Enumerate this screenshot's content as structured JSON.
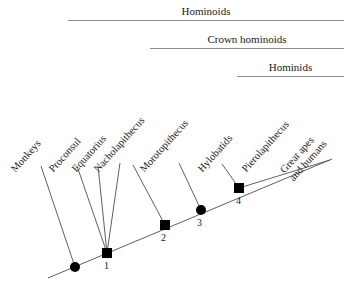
{
  "figure": {
    "type": "phylogenetic-tree",
    "background_color": "#ffffff",
    "line_color": "#4d4d4d",
    "rule_color": "#8c8c8c",
    "node_color": "#000000"
  },
  "clade_brackets": [
    {
      "id": "hominoids",
      "label": "Hominoids",
      "left": 68,
      "right": 344,
      "top": 4
    },
    {
      "id": "crown-hominoids",
      "label": "Crown hominoids",
      "left": 150,
      "right": 344,
      "top": 32
    },
    {
      "id": "hominids",
      "label": "Hominids",
      "left": 237,
      "right": 344,
      "top": 60
    }
  ],
  "taxa": [
    {
      "id": "monkeys",
      "label": "Monkeys",
      "label_x": 17,
      "label_y": 163,
      "tip_x": 41,
      "tip_y": 166,
      "base_x": 75,
      "base_y": 267
    },
    {
      "id": "proconsul",
      "label": "Proconsul",
      "label_x": 55,
      "label_y": 163,
      "tip_x": 77,
      "tip_y": 166,
      "base_x": 107,
      "base_y": 253
    },
    {
      "id": "equatorius",
      "label": "Equatorius",
      "label_x": 78,
      "label_y": 163,
      "tip_x": 98,
      "tip_y": 166,
      "base_x": 107,
      "base_y": 253
    },
    {
      "id": "nacholapithecus",
      "label": "Nacholapithecus",
      "label_x": 100,
      "label_y": 163,
      "tip_x": 120,
      "tip_y": 163,
      "base_x": 107,
      "base_y": 253
    },
    {
      "id": "morotopithecus",
      "label": "Morotopithecus",
      "label_x": 146,
      "label_y": 163,
      "tip_x": 133,
      "tip_y": 165,
      "base_x": 165,
      "base_y": 225
    },
    {
      "id": "hylobatids",
      "label": "Hylobatids",
      "label_x": 204,
      "label_y": 163,
      "tip_x": 179,
      "tip_y": 163,
      "base_x": 201,
      "base_y": 210
    },
    {
      "id": "pierolapithecus",
      "label": "Pierolapithecus",
      "label_x": 248,
      "label_y": 163,
      "tip_x": 222,
      "tip_y": 164,
      "base_x": 239,
      "base_y": 188
    },
    {
      "id": "great-apes-and-humans",
      "label": "Great apes\nand humans",
      "label_x": 295,
      "label_y": 160,
      "tip_x": 330,
      "tip_y": 160,
      "base_x": 239,
      "base_y": 188
    }
  ],
  "backbone": {
    "start_x": 48,
    "start_y": 278,
    "end_x": 332,
    "end_y": 159
  },
  "nodes": [
    {
      "id": "node-root-split",
      "shape": "circle",
      "number": "",
      "x": 75,
      "y": 267,
      "number_x": 0,
      "number_y": 0
    },
    {
      "id": "node-1",
      "shape": "square",
      "number": "1",
      "x": 107,
      "y": 253,
      "number_x": 104,
      "number_y": 261
    },
    {
      "id": "node-2",
      "shape": "square",
      "number": "2",
      "x": 165,
      "y": 225,
      "number_x": 161,
      "number_y": 233
    },
    {
      "id": "node-3",
      "shape": "circle",
      "number": "3",
      "x": 201,
      "y": 210,
      "number_x": 197,
      "number_y": 218
    },
    {
      "id": "node-4",
      "shape": "square",
      "number": "4",
      "x": 239,
      "y": 188,
      "number_x": 236,
      "number_y": 196
    }
  ]
}
